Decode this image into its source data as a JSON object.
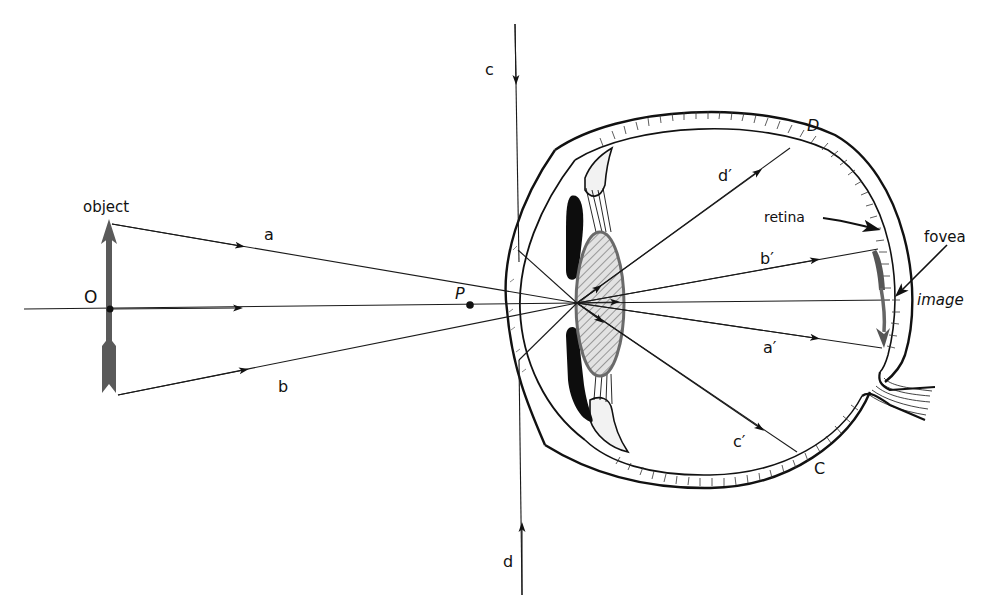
{
  "diagram": {
    "labels": {
      "object": "object",
      "O": "O",
      "P": "P",
      "a": "a",
      "b": "b",
      "c_top": "c",
      "d_bottom": "d",
      "D": "D",
      "C": "C",
      "d_prime": "d′",
      "b_prime": "b′",
      "a_prime": "a′",
      "c_prime": "c′",
      "retina": "retina",
      "fovea": "fovea",
      "image": "image"
    },
    "colors": {
      "ink": "#111111",
      "arrow_gray": "#5a5a5a",
      "lens_fill": "#d8d8d8",
      "lens_stroke": "#6a6a6a"
    },
    "points": {
      "object_point_O": [
        110,
        309
      ],
      "point_P": [
        470,
        305
      ],
      "nodal_point": [
        577,
        303
      ],
      "fovea": [
        890,
        300
      ]
    }
  }
}
